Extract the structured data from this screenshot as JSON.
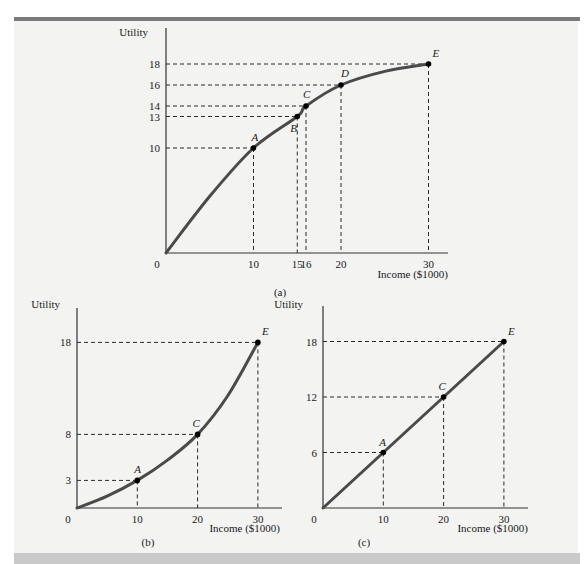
{
  "chart_data": [
    {
      "id": "a",
      "type": "line",
      "caption": "(a)",
      "title": "",
      "xlabel": "Income ($1000)",
      "ylabel": "Utility",
      "xlim": [
        0,
        33
      ],
      "ylim": [
        0,
        21
      ],
      "x_ticks": [
        "0",
        "10",
        "15",
        "16",
        "20",
        "30"
      ],
      "y_ticks": [
        "10",
        "13",
        "14",
        "16",
        "18"
      ],
      "grid": false,
      "shape": "concave (risk averse)",
      "points": [
        {
          "label": "A",
          "x": 10,
          "y": 10
        },
        {
          "label": "B",
          "x": 15,
          "y": 13
        },
        {
          "label": "C",
          "x": 16,
          "y": 14
        },
        {
          "label": "D",
          "x": 20,
          "y": 16
        },
        {
          "label": "E",
          "x": 30,
          "y": 18
        }
      ],
      "curve": {
        "x": [
          0,
          5,
          10,
          15,
          16,
          20,
          25,
          30
        ],
        "y": [
          0,
          5.4,
          10,
          13,
          14,
          16,
          17.3,
          18
        ]
      }
    },
    {
      "id": "b",
      "type": "line",
      "caption": "(b)",
      "title": "",
      "xlabel": "Income ($1000)",
      "ylabel": "Utility",
      "xlim": [
        0,
        34
      ],
      "ylim": [
        0,
        22
      ],
      "x_ticks": [
        "0",
        "10",
        "20",
        "30"
      ],
      "y_ticks": [
        "3",
        "8",
        "18"
      ],
      "grid": false,
      "shape": "convex (risk loving)",
      "points": [
        {
          "label": "A",
          "x": 10,
          "y": 3
        },
        {
          "label": "C",
          "x": 20,
          "y": 8
        },
        {
          "label": "E",
          "x": 30,
          "y": 18
        }
      ],
      "curve": {
        "x": [
          0,
          5,
          10,
          15,
          20,
          25,
          30
        ],
        "y": [
          0,
          1.3,
          3,
          5.2,
          8,
          12.2,
          18
        ]
      }
    },
    {
      "id": "c",
      "type": "line",
      "caption": "(c)",
      "title": "",
      "xlabel": "Income ($1000)",
      "ylabel": "Utility",
      "xlim": [
        0,
        34
      ],
      "ylim": [
        0,
        22
      ],
      "x_ticks": [
        "0",
        "10",
        "20",
        "30"
      ],
      "y_ticks": [
        "6",
        "12",
        "18"
      ],
      "grid": false,
      "shape": "linear (risk neutral)",
      "points": [
        {
          "label": "A",
          "x": 10,
          "y": 6
        },
        {
          "label": "C",
          "x": 20,
          "y": 12
        },
        {
          "label": "E",
          "x": 30,
          "y": 18
        }
      ],
      "curve": {
        "x": [
          0,
          30
        ],
        "y": [
          0,
          18
        ]
      }
    }
  ],
  "colors": {
    "curve": "#4a4a4a",
    "axis": "#333333",
    "dash": "#2a2a2a",
    "point": "#000000",
    "panel_bg": "#f3f3f2",
    "top_bar": "#7a7a7a",
    "bottom_band": "#c9c9c9"
  }
}
